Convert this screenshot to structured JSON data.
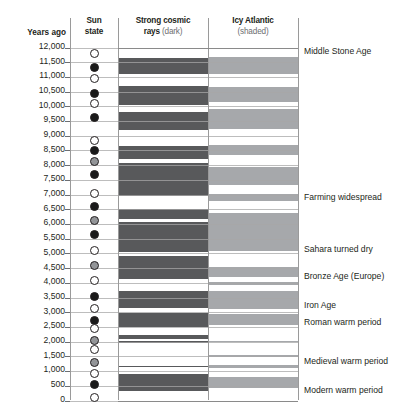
{
  "headers": {
    "years_ago": "Years ago",
    "sun_state_line1": "Sun",
    "sun_state_line2": "state",
    "rays_line1": "Strong cosmic",
    "rays_line2_bold": "rays",
    "rays_line2_sub": "(dark)",
    "icy_line1": "Icy Atlantic",
    "icy_line2_sub": "(shaded)"
  },
  "colors": {
    "dark_band": "#58595b",
    "shaded_band": "#a6a8ab",
    "axis": "#9a9a9a",
    "gridline": "#a7a7a7",
    "text": "#231f20",
    "subtext": "#6d6e71",
    "dot_white": "#ffffff",
    "dot_grey": "#939598",
    "dot_black": "#1a1a1a"
  },
  "chart_data": {
    "type": "heatmap",
    "title": "",
    "xlabel": "",
    "ylabel": "Years ago",
    "ylim": [
      0,
      12000
    ],
    "grid": true,
    "legend_position": "top",
    "y_ticks": [
      "12,000",
      "11,500",
      "11,000",
      "10,500",
      "10,000",
      "9,500",
      "9,000",
      "8,500",
      "8,000",
      "7,500",
      "7,000",
      "6,500",
      "6,000",
      "5,500",
      "5,000",
      "4,500",
      "4,000",
      "3,500",
      "3,000",
      "2,500",
      "2,000",
      "1,500",
      "1,000",
      "500",
      "0"
    ],
    "y_tick_values": [
      12000,
      11500,
      11000,
      10500,
      10000,
      9500,
      9000,
      8500,
      8000,
      7500,
      7000,
      6500,
      6000,
      5500,
      5000,
      4500,
      4000,
      3500,
      3000,
      2500,
      2000,
      1500,
      1000,
      500,
      0
    ],
    "columns": [
      {
        "name": "Sun state",
        "type": "dot-series"
      },
      {
        "name": "Strong cosmic rays (dark)",
        "type": "band-series",
        "shade": "dark"
      },
      {
        "name": "Icy Atlantic (shaded)",
        "type": "band-series",
        "shade": "shaded"
      }
    ],
    "sun_state": [
      {
        "year": 11750,
        "state": "white"
      },
      {
        "year": 11300,
        "state": "black"
      },
      {
        "year": 10900,
        "state": "white"
      },
      {
        "year": 10400,
        "state": "black"
      },
      {
        "year": 10050,
        "state": "white"
      },
      {
        "year": 9600,
        "state": "black"
      },
      {
        "year": 8800,
        "state": "white"
      },
      {
        "year": 8450,
        "state": "black"
      },
      {
        "year": 8100,
        "state": "grey"
      },
      {
        "year": 7650,
        "state": "black"
      },
      {
        "year": 7000,
        "state": "white"
      },
      {
        "year": 6550,
        "state": "black"
      },
      {
        "year": 6100,
        "state": "grey"
      },
      {
        "year": 5600,
        "state": "black"
      },
      {
        "year": 5050,
        "state": "white"
      },
      {
        "year": 4550,
        "state": "grey"
      },
      {
        "year": 4050,
        "state": "white"
      },
      {
        "year": 3500,
        "state": "black"
      },
      {
        "year": 3100,
        "state": "white"
      },
      {
        "year": 2700,
        "state": "black"
      },
      {
        "year": 2400,
        "state": "white"
      },
      {
        "year": 2020,
        "state": "grey"
      },
      {
        "year": 1700,
        "state": "white"
      },
      {
        "year": 1250,
        "state": "grey"
      },
      {
        "year": 900,
        "state": "white"
      },
      {
        "year": 500,
        "state": "black"
      },
      {
        "year": 60,
        "state": "white"
      }
    ],
    "cosmic_ray_bands": [
      {
        "from": 11620,
        "to": 11060
      },
      {
        "from": 10660,
        "to": 10000
      },
      {
        "from": 9780,
        "to": 9160
      },
      {
        "from": 8620,
        "to": 8160
      },
      {
        "from": 8030,
        "to": 6930
      },
      {
        "from": 6480,
        "to": 6130
      },
      {
        "from": 6020,
        "to": 5020
      },
      {
        "from": 4870,
        "to": 4100
      },
      {
        "from": 3700,
        "to": 3100
      },
      {
        "from": 2950,
        "to": 2450
      },
      {
        "from": 2180,
        "to": 2050
      },
      {
        "from": 1990,
        "to": 1930
      },
      {
        "from": 1150,
        "to": 1090
      },
      {
        "from": 870,
        "to": 280
      }
    ],
    "icy_atlantic_bands": [
      {
        "from": 11650,
        "to": 11080
      },
      {
        "from": 10640,
        "to": 10120
      },
      {
        "from": 9880,
        "to": 9200
      },
      {
        "from": 8640,
        "to": 8320
      },
      {
        "from": 7900,
        "to": 7300
      },
      {
        "from": 7000,
        "to": 6760
      },
      {
        "from": 6350,
        "to": 5050
      },
      {
        "from": 4500,
        "to": 4180
      },
      {
        "from": 4000,
        "to": 3880
      },
      {
        "from": 3680,
        "to": 3080
      },
      {
        "from": 2900,
        "to": 2520
      },
      {
        "from": 2000,
        "to": 1940
      },
      {
        "from": 1520,
        "to": 1440
      },
      {
        "from": 1180,
        "to": 1080
      },
      {
        "from": 780,
        "to": 380
      }
    ],
    "annotations": [
      {
        "year": 11820,
        "label": "Middle Stone Age"
      },
      {
        "year": 6880,
        "label": "Farming widespread"
      },
      {
        "year": 5080,
        "label": "Sahara turned dry"
      },
      {
        "year": 4180,
        "label": "Bronze Age (Europe)"
      },
      {
        "year": 3180,
        "label": "Iron Age"
      },
      {
        "year": 2600,
        "label": "Roman warm period"
      },
      {
        "year": 1300,
        "label": "Medieval warm period"
      },
      {
        "year": 300,
        "label": "Modern warm period"
      }
    ]
  }
}
